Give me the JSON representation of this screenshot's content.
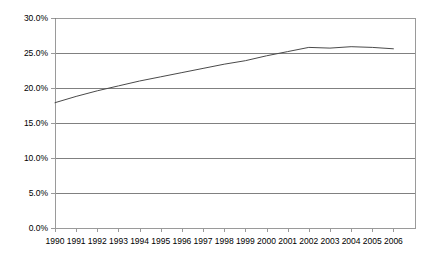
{
  "chart_data": {
    "type": "line",
    "title": "",
    "xlabel": "",
    "ylabel": "",
    "grid": true,
    "legend": false,
    "ylim": [
      0,
      30
    ],
    "ytick_values": [
      0,
      5,
      10,
      15,
      20,
      25,
      30
    ],
    "ytick_labels": [
      "0.0%",
      "5.0%",
      "10.0%",
      "15.0%",
      "20.0%",
      "25.0%",
      "30.0%"
    ],
    "categories": [
      "1990",
      "1991",
      "1992",
      "1993",
      "1994",
      "1995",
      "1996",
      "1997",
      "1998",
      "1999",
      "2000",
      "2001",
      "2002",
      "2003",
      "2004",
      "2005",
      "2006"
    ],
    "series": [
      {
        "name": "series-1",
        "color": "#4a4a4a",
        "values": [
          17.9,
          18.8,
          19.6,
          20.3,
          21.0,
          21.6,
          22.2,
          22.8,
          23.4,
          23.9,
          24.6,
          25.2,
          25.8,
          25.7,
          25.9,
          25.8,
          25.6
        ]
      }
    ]
  },
  "style": {
    "axis_color": "#9a9a9a",
    "grid_color": "#808080",
    "line_color": "#4a4a4a",
    "background": "#ffffff",
    "text_color": "#000000"
  },
  "geometry": {
    "plot_left": 55,
    "plot_right": 415,
    "plot_top": 18,
    "plot_bottom": 228
  }
}
